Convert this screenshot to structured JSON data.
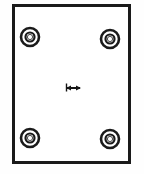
{
  "drawing": {
    "title": "Rectangular panel with four corner grommets",
    "background_color": "#fefefe",
    "line_color": "#1a1a1a",
    "fill_color": "#ffffff",
    "panel": {
      "label": "panel-outline",
      "shape": "rectangle",
      "x": 12,
      "y": 4,
      "width": 119,
      "height": 160,
      "stroke_width": 3,
      "fill": "#ffffff"
    },
    "grommets": [
      {
        "label": "grommet-top-left",
        "cx": 30,
        "cy": 37,
        "outer_r": 9,
        "mid_r": 6.5,
        "inner_r": 4.5,
        "hole_r": 2.6
      },
      {
        "label": "grommet-top-right",
        "cx": 110,
        "cy": 39,
        "outer_r": 9,
        "mid_r": 6.5,
        "inner_r": 4.5,
        "hole_r": 2.6
      },
      {
        "label": "grommet-bottom-left",
        "cx": 30,
        "cy": 138,
        "outer_r": 9,
        "mid_r": 6.5,
        "inner_r": 4.5,
        "hole_r": 2.6
      },
      {
        "label": "grommet-bottom-right",
        "cx": 110,
        "cy": 139,
        "outer_r": 9,
        "mid_r": 6.5,
        "inner_r": 4.5,
        "hole_r": 2.6
      }
    ],
    "center_marker": {
      "label": "center-dimension-arrow",
      "x1": 66,
      "x2": 81,
      "y": 88,
      "stroke_width": 2,
      "arrow_size": 4,
      "description": "small horizontal double-arrow dimension marker"
    }
  }
}
